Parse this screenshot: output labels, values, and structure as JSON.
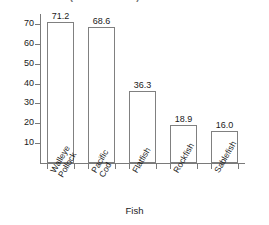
{
  "chart_data": {
    "type": "bar",
    "title": "",
    "title_clipped_fragment": "(in millions lbs)  Pareto Chart",
    "xlabel": "Fish",
    "ylabel": "",
    "categories": [
      "Walleye Pollock",
      "Pacific Cod",
      "Flatfish",
      "Rockfish",
      "Sablefish"
    ],
    "category_lines": [
      [
        "Walleye",
        "Pollock"
      ],
      [
        "Pacific",
        "Cod"
      ],
      [
        "Flatfish"
      ],
      [
        "Rockfish"
      ],
      [
        "Sablefish"
      ]
    ],
    "values": [
      71.2,
      68.6,
      36.3,
      18.9,
      16.0
    ],
    "value_labels": [
      "71.2",
      "68.6",
      "36.3",
      "18.9",
      "16.0"
    ],
    "ylim": [
      0,
      75
    ],
    "yticks": [
      10,
      20,
      30,
      40,
      50,
      60,
      70
    ],
    "ytick_labels": [
      "10",
      "20",
      "30",
      "40",
      "50",
      "60",
      "70"
    ],
    "grid": false,
    "legend": false,
    "bar_fill": "#ffffff",
    "bar_stroke": "#808080",
    "axis_color": "#7a7a7a",
    "text_color": "#1a1a1a"
  }
}
